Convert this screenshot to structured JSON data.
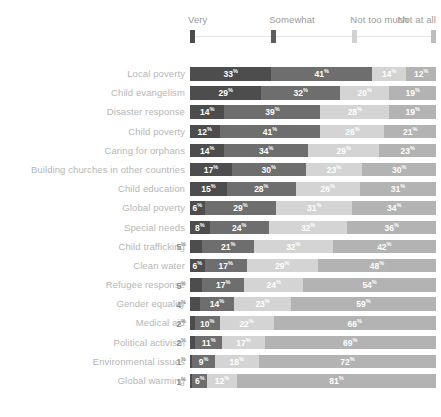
{
  "legend": {
    "items": [
      {
        "label": "Very",
        "color": "#4d4d4d",
        "pos": 0
      },
      {
        "label": "Somewhat",
        "color": "#5e5e5e",
        "pos": 33
      },
      {
        "label": "Not too much",
        "color": "#d2d2d2",
        "pos": 66
      },
      {
        "label": "Not at all",
        "color": "#bdbdbd",
        "pos": 99
      }
    ]
  },
  "colors": {
    "very": "#4d4d4d",
    "somewhat": "#6e6e6e",
    "not_too_much": "#d4d4d4",
    "not_at_all": "#b3b3b3",
    "label": "#b6b6b6",
    "legend_label": "#9a9a9a",
    "outside_value": "#8e8e8e"
  },
  "chart_data": {
    "type": "bar",
    "title": "",
    "xlabel": "",
    "ylabel": "",
    "stacked": true,
    "orientation": "horizontal",
    "percent": true,
    "xlim": [
      0,
      100
    ],
    "grid": false,
    "legend_position": "top",
    "categories": [
      "Local poverty",
      "Child evangelism",
      "Disaster response",
      "Child poverty",
      "Caring for orphans",
      "Building churches in other countries",
      "Child education",
      "Global poverty",
      "Special needs",
      "Child trafficking",
      "Clean water",
      "Refugee response",
      "Gender equality",
      "Medical aid",
      "Political activism",
      "Environmental issues",
      "Global warming"
    ],
    "series": [
      {
        "name": "Very",
        "values": [
          33,
          29,
          14,
          12,
          14,
          17,
          15,
          6,
          8,
          5,
          6,
          5,
          4,
          2,
          2,
          1,
          1
        ]
      },
      {
        "name": "Somewhat",
        "values": [
          41,
          32,
          39,
          41,
          34,
          30,
          28,
          29,
          24,
          21,
          17,
          17,
          14,
          10,
          11,
          9,
          6
        ]
      },
      {
        "name": "Not too much",
        "values": [
          14,
          20,
          28,
          26,
          29,
          23,
          26,
          31,
          32,
          32,
          29,
          24,
          23,
          22,
          17,
          18,
          12
        ]
      },
      {
        "name": "Not at all",
        "values": [
          12,
          19,
          19,
          21,
          23,
          30,
          31,
          34,
          36,
          42,
          48,
          54,
          59,
          66,
          69,
          72,
          81
        ]
      }
    ]
  },
  "rows": [
    {
      "label": "Local poverty",
      "values": [
        33,
        41,
        14,
        12
      ],
      "outside": null
    },
    {
      "label": "Child evangelism",
      "values": [
        29,
        32,
        20,
        19
      ],
      "outside": null
    },
    {
      "label": "Disaster response",
      "values": [
        14,
        39,
        28,
        19
      ],
      "outside": null
    },
    {
      "label": "Child poverty",
      "values": [
        12,
        41,
        26,
        21
      ],
      "outside": null
    },
    {
      "label": "Caring for orphans",
      "values": [
        14,
        34,
        29,
        23
      ],
      "outside": null
    },
    {
      "label": "Building churches in other countries",
      "values": [
        17,
        30,
        23,
        30
      ],
      "outside": null
    },
    {
      "label": "Child education",
      "values": [
        15,
        28,
        26,
        31
      ],
      "outside": null
    },
    {
      "label": "Global poverty",
      "values": [
        6,
        29,
        31,
        34
      ],
      "outside": null
    },
    {
      "label": "Special needs",
      "values": [
        8,
        24,
        32,
        36
      ],
      "outside": null
    },
    {
      "label": "Child trafficking",
      "values": [
        5,
        21,
        32,
        42
      ],
      "outside": "5"
    },
    {
      "label": "Clean water",
      "values": [
        6,
        17,
        29,
        48
      ],
      "outside": null
    },
    {
      "label": "Refugee response",
      "values": [
        5,
        17,
        24,
        54
      ],
      "outside": "5"
    },
    {
      "label": "Gender equality",
      "values": [
        4,
        14,
        23,
        59
      ],
      "outside": "4"
    },
    {
      "label": "Medical aid",
      "values": [
        2,
        10,
        22,
        66
      ],
      "outside": "2"
    },
    {
      "label": "Political activism",
      "values": [
        2,
        11,
        17,
        69
      ],
      "outside": "2"
    },
    {
      "label": "Environmental issues",
      "values": [
        1,
        9,
        18,
        72
      ],
      "outside": "1"
    },
    {
      "label": "Global warming",
      "values": [
        1,
        6,
        12,
        81
      ],
      "outside": "1"
    }
  ]
}
